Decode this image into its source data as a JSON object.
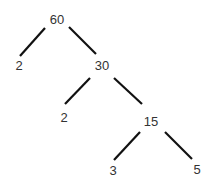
{
  "diagram": {
    "type": "factor-tree",
    "nodes": [
      {
        "id": "n60",
        "label": "60",
        "x": 57,
        "y": 19
      },
      {
        "id": "n2a",
        "label": "2",
        "x": 19,
        "y": 65
      },
      {
        "id": "n30",
        "label": "30",
        "x": 102,
        "y": 65
      },
      {
        "id": "n2b",
        "label": "2",
        "x": 64,
        "y": 117
      },
      {
        "id": "n15",
        "label": "15",
        "x": 151,
        "y": 121
      },
      {
        "id": "n3",
        "label": "3",
        "x": 113,
        "y": 170
      },
      {
        "id": "n5",
        "label": "5",
        "x": 197,
        "y": 169
      }
    ],
    "edges": [
      {
        "from": "60",
        "to": "2"
      },
      {
        "from": "60",
        "to": "30"
      },
      {
        "from": "30",
        "to": "2"
      },
      {
        "from": "30",
        "to": "15"
      },
      {
        "from": "15",
        "to": "3"
      },
      {
        "from": "15",
        "to": "5"
      }
    ],
    "line_color": "#111111",
    "text_color": "#333333"
  }
}
